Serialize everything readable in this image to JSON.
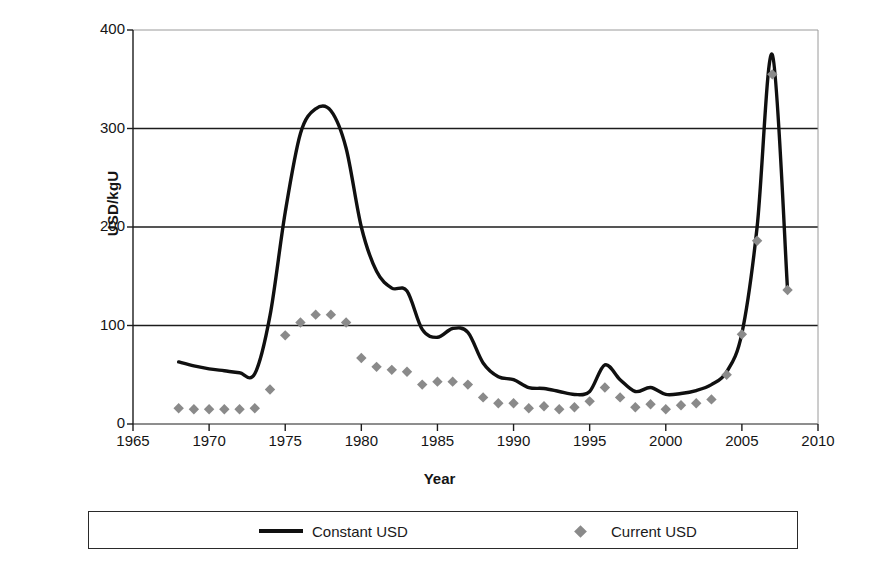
{
  "axes": {
    "ylabel": "USD/kgU",
    "xlabel": "Year",
    "yticks": [
      "0",
      "100",
      "200",
      "300",
      "400"
    ],
    "xticks": [
      "1965",
      "1970",
      "1975",
      "1980",
      "1985",
      "1990",
      "1995",
      "2000",
      "2005",
      "2010"
    ]
  },
  "legend": {
    "constant_label": "Constant USD",
    "current_label": "Current USD",
    "line_color": "#101010",
    "marker_color": "#8a8a8a"
  },
  "chart_data": {
    "type": "line",
    "title": "",
    "subtitle": "",
    "xlabel": "Year",
    "ylabel": "USD/kgU",
    "xlim": [
      1965,
      2010
    ],
    "ylim": [
      0,
      400
    ],
    "xticks": [
      1965,
      1970,
      1975,
      1980,
      1985,
      1990,
      1995,
      2000,
      2005,
      2010
    ],
    "yticks": [
      0,
      100,
      200,
      300,
      400
    ],
    "grid": "horizontal",
    "legend_position": "bottom",
    "series": [
      {
        "name": "Constant USD",
        "style": "line",
        "color": "#101010",
        "x": [
          1968,
          1969,
          1970,
          1971,
          1972,
          1973,
          1974,
          1975,
          1976,
          1977,
          1978,
          1979,
          1980,
          1981,
          1982,
          1983,
          1984,
          1985,
          1986,
          1987,
          1988,
          1989,
          1990,
          1991,
          1992,
          1993,
          1994,
          1995,
          1996,
          1997,
          1998,
          1999,
          2000,
          2001,
          2002,
          2003,
          2004,
          2005,
          2006,
          2007,
          2008
        ],
        "values": [
          63,
          59,
          56,
          54,
          52,
          51,
          110,
          215,
          295,
          320,
          318,
          280,
          200,
          155,
          138,
          135,
          96,
          88,
          97,
          93,
          62,
          48,
          45,
          37,
          36,
          33,
          30,
          33,
          60,
          45,
          33,
          37,
          30,
          31,
          34,
          40,
          53,
          92,
          200,
          375,
          136
        ]
      },
      {
        "name": "Current USD",
        "style": "scatter",
        "marker": "diamond",
        "color": "#8a8a8a",
        "x": [
          1968,
          1969,
          1970,
          1971,
          1972,
          1973,
          1974,
          1975,
          1976,
          1977,
          1978,
          1979,
          1980,
          1981,
          1982,
          1983,
          1984,
          1985,
          1986,
          1987,
          1988,
          1989,
          1990,
          1991,
          1992,
          1993,
          1994,
          1995,
          1996,
          1997,
          1998,
          1999,
          2000,
          2001,
          2002,
          2003,
          2004,
          2005,
          2006,
          2007,
          2008
        ],
        "values": [
          16,
          15,
          15,
          15,
          15,
          16,
          35,
          90,
          103,
          111,
          111,
          103,
          67,
          58,
          55,
          53,
          40,
          43,
          43,
          40,
          27,
          21,
          21,
          16,
          18,
          15,
          17,
          23,
          37,
          27,
          17,
          20,
          15,
          19,
          21,
          25,
          50,
          91,
          186,
          355,
          136
        ]
      }
    ]
  }
}
